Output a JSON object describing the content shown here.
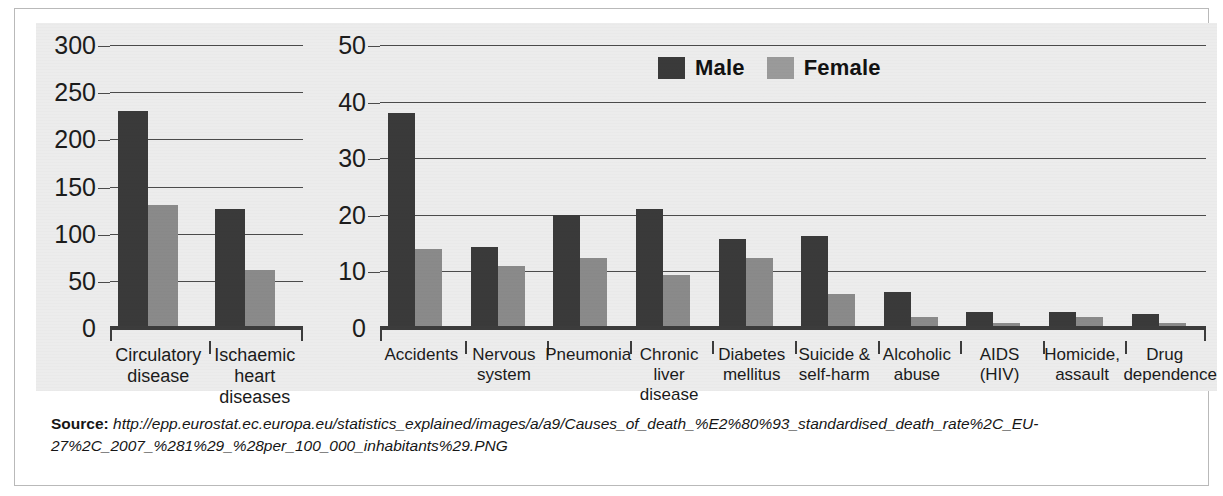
{
  "legend": {
    "items": [
      {
        "label": "Male",
        "color": "#3a3a3a",
        "name": "legend-male"
      },
      {
        "label": "Female",
        "color": "#9a9a9a",
        "name": "legend-female"
      }
    ]
  },
  "source": {
    "label": "Source:",
    "line1": "http://epp.eurostat.ec.europa.eu/statistics_explained/images/a/a9/Causes_of_death_%E2%80%93_standardised_death_rate%2C_EU-",
    "line2": "27%2C_2007_%281%29_%28per_100_000_inhabitants%29.PNG"
  },
  "chart_data": [
    {
      "type": "bar",
      "name": "left-chart",
      "title": "",
      "xlabel": "",
      "ylabel": "",
      "ylim": [
        0,
        300
      ],
      "yticks": [
        0,
        50,
        100,
        150,
        200,
        250,
        300
      ],
      "ytick_labels": [
        "0",
        "50",
        "100",
        "150",
        "200",
        "250",
        "300"
      ],
      "grid": true,
      "legend_position": "none",
      "categories": [
        "Circulatory disease",
        "Ischaemic heart diseases"
      ],
      "category_lines": [
        [
          "Circulatory",
          "disease"
        ],
        [
          "Ischaemic",
          "heart",
          "diseases"
        ]
      ],
      "series": [
        {
          "name": "Male",
          "color": "#3a3a3a",
          "values": [
            230,
            126
          ]
        },
        {
          "name": "Female",
          "color": "#8a8a8a",
          "values": [
            130,
            62
          ]
        }
      ]
    },
    {
      "type": "bar",
      "name": "right-chart",
      "title": "",
      "xlabel": "",
      "ylabel": "",
      "ylim": [
        0,
        50
      ],
      "yticks": [
        0,
        10,
        20,
        30,
        40,
        50
      ],
      "ytick_labels": [
        "0",
        "10",
        "20",
        "30",
        "40",
        "50"
      ],
      "grid": true,
      "legend_position": "top-center",
      "categories": [
        "Accidents",
        "Nervous system",
        "Pneumonia",
        "Chronic liver disease",
        "Diabetes mellitus",
        "Suicide & self-harm",
        "Alcoholic abuse",
        "AIDS (HIV)",
        "Homicide, assault",
        "Drug dependence"
      ],
      "category_lines": [
        [
          "Accidents"
        ],
        [
          "Nervous",
          "system"
        ],
        [
          "Pneumonia"
        ],
        [
          "Chronic liver",
          "disease"
        ],
        [
          "Diabetes",
          "mellitus"
        ],
        [
          "Suicide &",
          "self-harm"
        ],
        [
          "Alcoholic",
          "abuse"
        ],
        [
          "AIDS (HIV)"
        ],
        [
          "Homicide,",
          "assault"
        ],
        [
          "Drug",
          "dependence"
        ]
      ],
      "series": [
        {
          "name": "Male",
          "color": "#3a3a3a",
          "values": [
            38,
            14.3,
            20,
            21,
            15.7,
            16.3,
            6.3,
            2.8,
            2.8,
            2.5
          ]
        },
        {
          "name": "Female",
          "color": "#8a8a8a",
          "values": [
            14,
            11,
            12.3,
            9.3,
            12.3,
            6,
            2,
            0.8,
            2,
            0.8
          ]
        }
      ]
    }
  ]
}
